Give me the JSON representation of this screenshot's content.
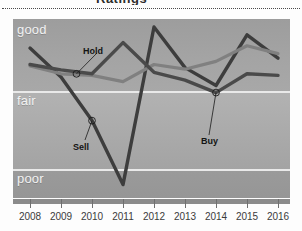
{
  "chart_data": {
    "type": "line",
    "title": "Ratings",
    "xlabel": "",
    "ylabel": "",
    "grid": true,
    "legend_position": "inline-annotations",
    "x": [
      2008,
      2009,
      2010,
      2011,
      2012,
      2013,
      2014,
      2015,
      2016
    ],
    "x_tick_labels": [
      "2008",
      "2009",
      "2010",
      "2011",
      "2012",
      "2013",
      "2014",
      "2015",
      "2016"
    ],
    "y_tick_labels": [
      "good",
      "fair",
      "poor"
    ],
    "y_category_scale": [
      "poor",
      "fair",
      "good"
    ],
    "ylim": [
      0,
      3
    ],
    "series": [
      {
        "name": "Sell",
        "color": "#3d3d3d",
        "values": [
          2.55,
          2.18,
          1.62,
          0.8,
          2.82,
          2.3,
          2.07,
          2.72,
          2.42
        ]
      },
      {
        "name": "Hold",
        "color": "#808080",
        "values": [
          2.32,
          2.22,
          2.2,
          2.12,
          2.34,
          2.28,
          2.38,
          2.58,
          2.48
        ]
      },
      {
        "name": "Buy",
        "color": "#4a4a4a",
        "values": [
          2.34,
          2.27,
          2.22,
          2.62,
          2.24,
          2.14,
          1.98,
          2.22,
          2.2
        ]
      }
    ],
    "annotations": [
      {
        "label": "Hold",
        "x": 2009.5,
        "y": 2.22
      },
      {
        "label": "Sell",
        "x": 2010.0,
        "y": 1.62
      },
      {
        "label": "Buy",
        "x": 2014.0,
        "y": 1.98
      }
    ],
    "colors": {
      "band_good": "#a4a4a4",
      "band_fair": "#ababab",
      "band_poor": "#979797",
      "gridline": "#e9e9e9",
      "axis": "#8b8b8b",
      "ylabel_text": "#f2f2f2",
      "xlabel_text": "#3b3b3b"
    }
  }
}
